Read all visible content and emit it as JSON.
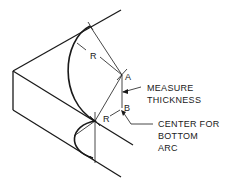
{
  "diagram": {
    "labels": {
      "radius_top": "R",
      "radius_bottom": "R",
      "point_a": "A",
      "point_b": "B",
      "measure_line1": "MEASURE",
      "measure_line2": "THICKNESS",
      "center_line1": "CENTER FOR",
      "center_line2": "BOTTOM",
      "center_line3": "ARC"
    },
    "colors": {
      "stroke": "#1a1a1a",
      "background": "#ffffff"
    }
  }
}
